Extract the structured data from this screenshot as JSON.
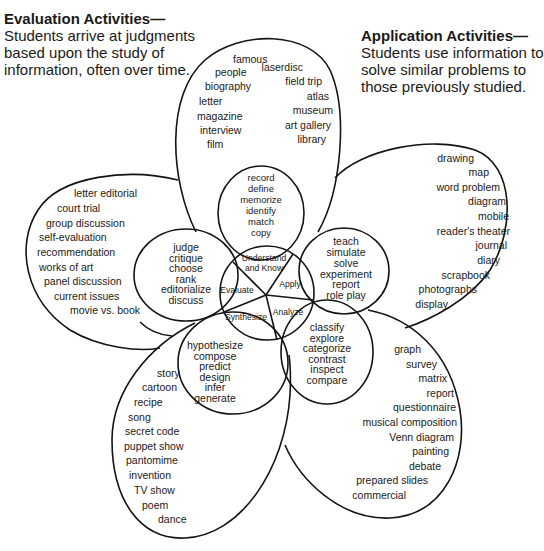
{
  "captions": {
    "evaluation": {
      "title": "Evaluation Activities—",
      "lines": [
        "Students arrive at judgments",
        "based upon the study of",
        "information, often over time."
      ]
    },
    "application": {
      "title": "Application Activities—",
      "lines": [
        "Students use information to",
        "solve similar problems to",
        "those previously studied."
      ]
    }
  },
  "center": {
    "segments": [
      "Understand and Know",
      "Apply",
      "Analyze",
      "Synthesize",
      "Evaluate"
    ],
    "understand_line1": "Understand",
    "understand_line2": "and Know",
    "apply": "Apply",
    "analyze": "Analyze",
    "synthesize": "Synthesize",
    "evaluate": "Evaluate"
  },
  "inner_petals": {
    "understand": [
      "record",
      "define",
      "memorize",
      "identify",
      "match",
      "copy"
    ],
    "apply": [
      "teach",
      "simulate",
      "solve",
      "experiment",
      "report",
      "role play"
    ],
    "analyze": [
      "classify",
      "explore",
      "categorize",
      "contrast",
      "inspect",
      "compare"
    ],
    "synthesize": [
      "hypothesize",
      "compose",
      "predict",
      "design",
      "infer",
      "generate"
    ],
    "evaluate": [
      "judge",
      "critique",
      "choose",
      "rank",
      "editorialize",
      "discuss"
    ]
  },
  "outer_petals": {
    "understand": {
      "left": [
        "famous",
        "people",
        "biography",
        "letter",
        "magazine",
        "interview",
        "film"
      ],
      "right": [
        "laserdisc",
        "field trip",
        "atlas",
        "museum",
        "art gallery",
        "library"
      ]
    },
    "apply": [
      "drawing",
      "map",
      "word problem",
      "diagram",
      "mobile",
      "reader's theater",
      "journal",
      "diary",
      "scrapbook",
      "photographs",
      "display"
    ],
    "analyze": [
      "graph",
      "survey",
      "matrix",
      "report",
      "questionnaire",
      "musical composition",
      "Venn diagram",
      "painting",
      "debate",
      "prepared slides",
      "commercial"
    ],
    "synthesize": [
      "story",
      "cartoon",
      "recipe",
      "song",
      "secret code",
      "puppet show",
      "pantomime",
      "invention",
      "TV show",
      "poem",
      "dance"
    ],
    "evaluate": [
      "letter editorial",
      "court trial",
      "group discussion",
      "self-evaluation",
      "recommendation",
      "works of art",
      "panel discussion",
      "current issues",
      "movie vs. book"
    ]
  }
}
